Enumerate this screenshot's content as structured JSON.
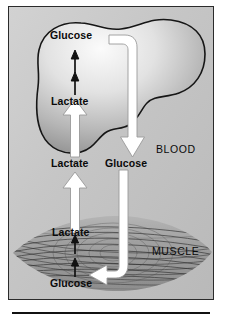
{
  "diagram": {
    "panel_bg": "#c3c3c3",
    "ink": "#0a0a0a",
    "arrow_fill": "#ffffff",
    "arrow_stroke": "#8f8f8f",
    "liver": {
      "name": "liver-organ",
      "fill_light": "#f2f2f2",
      "fill_dark": "#8e8e8e",
      "outline": "#161616",
      "labels": {
        "product": "Glucose",
        "substrate": "Lactate"
      }
    },
    "muscle": {
      "name": "muscle-tissue",
      "fill": "#a9a9a9",
      "striation": "#3a3a3a",
      "labels": {
        "substrate": "Glucose",
        "product": "Lactate"
      }
    },
    "blood": {
      "region_label": "BLOOD",
      "lactate_label": "Lactate",
      "glucose_label": "Glucose"
    },
    "muscle_region_label": "MUSCLE",
    "flows": [
      {
        "name": "liver-lactate-to-glucose",
        "from": "Lactate",
        "to": "Glucose",
        "style": "thin-black-arrow",
        "direction": "up"
      },
      {
        "name": "blood-lactate-to-liver-lactate",
        "from": "Lactate",
        "to": "Lactate",
        "style": "white-block-arrow",
        "direction": "up"
      },
      {
        "name": "muscle-lactate-to-blood-lactate",
        "from": "Lactate",
        "to": "Lactate",
        "style": "white-block-arrow",
        "direction": "up"
      },
      {
        "name": "liver-glucose-to-blood-glucose",
        "from": "Glucose",
        "to": "Glucose",
        "style": "white-block-arrow",
        "direction": "down"
      },
      {
        "name": "blood-glucose-to-muscle-glucose",
        "from": "Glucose",
        "to": "Glucose",
        "style": "white-block-arrow",
        "direction": "left"
      },
      {
        "name": "muscle-glucose-to-lactate",
        "from": "Glucose",
        "to": "Lactate",
        "style": "thin-black-arrow",
        "direction": "up"
      }
    ]
  }
}
